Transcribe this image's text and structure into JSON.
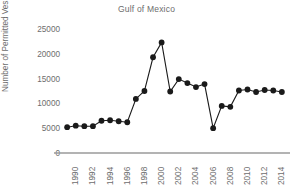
{
  "chart_data": {
    "type": "line",
    "title": "Gulf of Mexico",
    "xlabel": "",
    "ylabel": "Number of Permitted Vessels",
    "grid": false,
    "legend": false,
    "marker": "filled-circle",
    "line_color": "#1a1a1a",
    "marker_color": "#1a1a1a",
    "axis_color": "#9a9a9a",
    "text_color": "#6d6d6d",
    "background_color": "#ffffff",
    "xlim": [
      1989.4,
      2015.6
    ],
    "ylim": [
      0,
      25000
    ],
    "yticks": [
      0,
      5000,
      10000,
      15000,
      20000,
      25000
    ],
    "ytick_labels": [
      "0",
      "5000",
      "10000",
      "15000",
      "20000",
      "25000"
    ],
    "xticks": [
      1990,
      1992,
      1994,
      1996,
      1998,
      2000,
      2002,
      2004,
      2006,
      2008,
      2010,
      2012,
      2014
    ],
    "xtick_labels": [
      "1990",
      "1992",
      "1994",
      "1996",
      "1998",
      "2000",
      "2002",
      "2004",
      "2006",
      "2008",
      "2010",
      "2012",
      "2014"
    ],
    "x": [
      1990,
      1991,
      1992,
      1993,
      1994,
      1995,
      1996,
      1997,
      1998,
      1999,
      2000,
      2001,
      2002,
      2003,
      2004,
      2005,
      2006,
      2007,
      2008,
      2009,
      2010,
      2011,
      2012,
      2013,
      2014,
      2015
    ],
    "values": [
      5200,
      5500,
      5400,
      5400,
      6500,
      6600,
      6400,
      6200,
      10900,
      12500,
      19300,
      22300,
      12400,
      14900,
      14100,
      13300,
      13900,
      5000,
      9500,
      9300,
      12600,
      12800,
      12300,
      12700,
      12600,
      12300
    ],
    "series": [
      {
        "name": "Permitted Vessels",
        "values": [
          5200,
          5500,
          5400,
          5400,
          6500,
          6600,
          6400,
          6200,
          10900,
          12500,
          19300,
          22300,
          12400,
          14900,
          14100,
          13300,
          13900,
          5000,
          9500,
          9300,
          12600,
          12800,
          12300,
          12700,
          12600,
          12300
        ]
      }
    ]
  }
}
